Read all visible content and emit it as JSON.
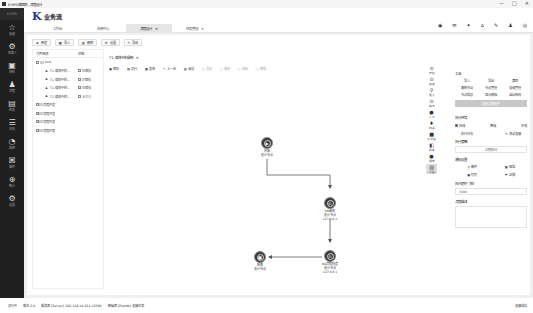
{
  "window": {
    "title": "K-RPA编辑器 - 流程设计",
    "controls": [
      "—",
      "□",
      "✕"
    ]
  },
  "sidebar": {
    "brand": "K-RPA",
    "items": [
      {
        "icon": "☆",
        "label": "收藏"
      },
      {
        "icon": "⚙",
        "label": "机器人"
      },
      {
        "icon": "▣",
        "label": "资料"
      },
      {
        "icon": "♟",
        "label": "流程"
      },
      {
        "icon": "▤",
        "label": "任务"
      },
      {
        "icon": "☰",
        "label": "日志"
      },
      {
        "icon": "◔",
        "label": "监控"
      },
      {
        "icon": "⌘",
        "label": "插件"
      },
      {
        "icon": "⊕",
        "label": "统计"
      },
      {
        "icon": "⚙",
        "label": "设置"
      }
    ]
  },
  "header": {
    "logo_mark": "K",
    "logo_name": "业务流",
    "tabs": [
      {
        "label": "工作台",
        "closable": false,
        "active": false
      },
      {
        "label": "应用中心",
        "closable": false,
        "active": false
      },
      {
        "label": "流程设计",
        "closable": true,
        "active": true
      },
      {
        "label": "任务管理",
        "closable": true,
        "active": false
      }
    ],
    "icons": [
      "◉",
      "✉",
      "✦",
      "⌂",
      "✎",
      "♟",
      "◎"
    ]
  },
  "left_toolbar": [
    {
      "icon": "⊕",
      "label": "新建"
    },
    {
      "icon": "▦",
      "label": "导入"
    },
    {
      "icon": "▤",
      "label": "删除"
    },
    {
      "icon": "⚙",
      "label": "设置"
    },
    {
      "icon": "✎",
      "label": "导出"
    }
  ],
  "tree": {
    "headers": [
      "文件名称",
      "状态"
    ],
    "root": "test",
    "items": [
      {
        "name": "T1-编排中的...",
        "status": "已保存",
        "active": true
      },
      {
        "name": "T1-编排中的...",
        "status": "已保存",
        "active": true
      },
      {
        "name": "T1-编排中的...",
        "status": "已保存",
        "active": true
      },
      {
        "name": "T1-编排中的...",
        "status": "未保存",
        "active": false
      }
    ],
    "folders": [
      "流程开发",
      "流程开发",
      "流程开发",
      "流程开发"
    ]
  },
  "file_tab": {
    "label": "T1-编排中的调用"
  },
  "canvas_toolbar": [
    {
      "icon": "▣",
      "label": "保存",
      "disabled": false
    },
    {
      "icon": "▤",
      "label": "运行",
      "disabled": false
    },
    {
      "icon": "▦",
      "label": "发布",
      "disabled": false
    },
    {
      "icon": "↶",
      "label": "上一步",
      "disabled": false
    },
    {
      "icon": "▧",
      "label": "调试",
      "disabled": false
    },
    {
      "icon": "▢",
      "label": "导出",
      "disabled": true
    },
    {
      "icon": "▢",
      "label": "复制",
      "disabled": true
    },
    {
      "icon": "▢",
      "label": "粘贴",
      "disabled": true
    },
    {
      "icon": "▢",
      "label": "撤销",
      "disabled": true
    }
  ],
  "nodes": [
    {
      "id": "start",
      "title": "开始",
      "sub": "设计节点",
      "ip": "",
      "icon": "▶",
      "x": 150,
      "y": 62
    },
    {
      "id": "n1",
      "title": "OA审批",
      "sub": "设计节点",
      "ip": "127.0.0.1",
      "icon": "✇",
      "x": 213,
      "y": 122
    },
    {
      "id": "n2",
      "title": "OA流程创建",
      "sub": "设计节点",
      "ip": "127.0.0.1",
      "icon": "✇",
      "x": 213,
      "y": 175
    },
    {
      "id": "end",
      "title": "结束",
      "sub": "设计节点",
      "ip": "",
      "icon": "■",
      "x": 143,
      "y": 176
    }
  ],
  "right_tools": [
    {
      "icon": "⊙",
      "label": "开始"
    },
    {
      "icon": "⊙",
      "label": "结束"
    },
    {
      "icon": "⚲",
      "label": "搜索"
    },
    {
      "icon": "⊙",
      "label": "等待"
    },
    {
      "icon": "●",
      "label": "人工"
    },
    {
      "icon": "♦",
      "label": "网关"
    },
    {
      "icon": "■",
      "label": "子流程"
    },
    {
      "icon": "◧",
      "label": "脚本"
    },
    {
      "icon": "●",
      "label": "通知"
    },
    {
      "icon": "▧",
      "label": "机器"
    }
  ],
  "panel": {
    "tool_title": "工具",
    "tools": [
      "导入",
      "导出",
      "清除",
      "复制节点",
      "节点管理",
      "连线管理",
      "节点信息",
      "显示网格",
      "自动布局"
    ],
    "selected_bar": "选择流程组件",
    "exec_env_title": "执行环境",
    "exec_options": [
      {
        "label": "在线",
        "checked": true
      },
      {
        "label": "离线"
      },
      {
        "label": "本地"
      }
    ],
    "exec_actions": [
      "执行日志",
      "测试连接"
    ],
    "exec_strategy_title": "执行策略",
    "exec_strategy_value": "立即执行",
    "notify_title": "通知设置",
    "notify_opts": [
      "邮件",
      "短信",
      "钉钉",
      "企微"
    ],
    "timeout_title": "执行超时（秒）",
    "timeout_value": "3600",
    "desc_title": "流程描述"
  },
  "status_bar": {
    "items": [
      "运行中",
      "版本 2.0",
      "服务器 [Server] 192.168.10.221:12580",
      "数据库 [Postdb] 连接正常"
    ],
    "right": "连接成功"
  }
}
